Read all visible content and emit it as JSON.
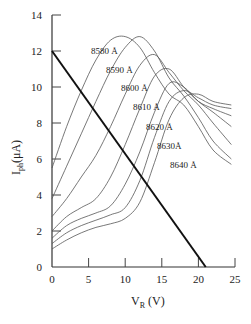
{
  "chart_data": {
    "type": "line",
    "title": "",
    "xlabel": "V_R (V)",
    "ylabel": "I_ph(μA)",
    "xlim": [
      0,
      25
    ],
    "ylim": [
      0,
      14
    ],
    "x_ticks": [
      "0",
      "5",
      "10",
      "15",
      "20",
      "25"
    ],
    "y_ticks": [
      "0",
      "2",
      "4",
      "6",
      "8",
      "10",
      "12",
      "14"
    ],
    "grid": false,
    "series": [
      {
        "name": "8580 Å",
        "x": [
          0,
          2,
          4,
          6,
          8,
          10,
          12,
          14,
          16,
          18,
          20,
          22,
          24.5
        ],
        "y": [
          5.5,
          7.8,
          9.8,
          11.5,
          12.6,
          12.8,
          12.2,
          10.8,
          9.6,
          9.0,
          7.8,
          6.5,
          5.7
        ]
      },
      {
        "name": "8590 Å",
        "x": [
          0,
          2,
          4,
          6,
          8,
          10,
          12,
          14,
          16,
          18,
          20,
          22,
          24.5
        ],
        "y": [
          3.8,
          5.6,
          7.4,
          9.2,
          10.9,
          12.2,
          12.8,
          12.0,
          10.5,
          9.5,
          8.3,
          7.0,
          6.0
        ]
      },
      {
        "name": "8600 Å",
        "x": [
          0,
          2,
          4,
          6,
          8,
          10,
          12,
          14,
          16,
          18,
          20,
          22,
          24.5
        ],
        "y": [
          2.8,
          3.8,
          5.0,
          6.2,
          7.8,
          9.6,
          11.2,
          11.8,
          10.8,
          9.8,
          9.0,
          8.0,
          6.8
        ]
      },
      {
        "name": "8610 Å",
        "x": [
          0,
          2,
          4,
          6,
          8,
          10,
          12,
          14,
          16,
          18,
          20,
          22,
          24.5
        ],
        "y": [
          2.0,
          2.8,
          3.3,
          3.8,
          5.0,
          6.8,
          8.8,
          10.6,
          11.0,
          10.0,
          9.2,
          8.6,
          7.8
        ]
      },
      {
        "name": "8620 Å",
        "x": [
          0,
          2,
          4,
          6,
          8,
          10,
          12,
          14,
          16,
          18,
          20,
          22,
          24.5
        ],
        "y": [
          1.6,
          2.3,
          2.7,
          3.0,
          3.4,
          4.6,
          6.4,
          8.6,
          10.2,
          10.0,
          9.2,
          8.8,
          8.4
        ]
      },
      {
        "name": "8630 Å",
        "x": [
          0,
          2,
          4,
          6,
          8,
          10,
          12,
          14,
          16,
          18,
          20,
          22,
          24.5
        ],
        "y": [
          1.3,
          1.9,
          2.3,
          2.6,
          2.9,
          3.3,
          4.8,
          7.2,
          9.2,
          9.8,
          9.4,
          9.0,
          8.8
        ]
      },
      {
        "name": "8640 Å",
        "x": [
          0,
          2,
          4,
          6,
          8,
          10,
          12,
          14,
          16,
          18,
          20,
          22,
          24.5
        ],
        "y": [
          1.0,
          1.5,
          1.9,
          2.2,
          2.4,
          2.7,
          3.6,
          5.8,
          8.2,
          9.4,
          9.6,
          9.2,
          9.0
        ]
      },
      {
        "name": "load line",
        "x": [
          0,
          21
        ],
        "y": [
          12,
          0
        ]
      }
    ],
    "annotations": [
      "8580 Å",
      "8590 Å",
      "8600 Å",
      "8610 Å",
      "8620 Å",
      "8630Å",
      "8640 Å"
    ]
  },
  "labels": {
    "ylabel_main": "I",
    "ylabel_sub": "ph",
    "ylabel_unit": "(μA)",
    "xlabel_main": "V",
    "xlabel_sub": "R",
    "xlabel_unit": " (V)"
  }
}
